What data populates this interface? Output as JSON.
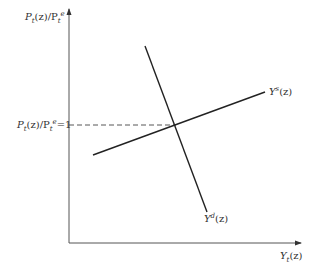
{
  "diagram": {
    "title": "",
    "y_axis_label": {
      "main": "P",
      "sub1": "t",
      "mid": "(z)/P",
      "sub2": "t",
      "sup2": "e"
    },
    "x_axis_label": {
      "main": "Y",
      "sub": "t",
      "tail": "(z)"
    },
    "equilibrium_label": {
      "main": "P",
      "sub1": "t",
      "mid": "(z)/P",
      "sub2": "t",
      "sup2": "e",
      "tail": "=1"
    },
    "supply_curve_label": {
      "main": "Y",
      "sup": "s",
      "tail": "(z)"
    },
    "demand_curve_label": {
      "main": "Y",
      "sup": "d",
      "tail": "(z)"
    },
    "colors": {
      "axis": "#555555",
      "curve": "#222222",
      "dash": "#444444",
      "text": "#333333"
    }
  }
}
